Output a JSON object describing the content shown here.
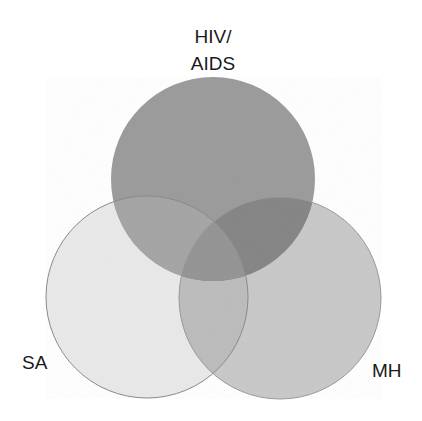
{
  "diagram": {
    "type": "venn",
    "sets": [
      {
        "id": "hiv",
        "label_lines": [
          "HIV/",
          "AIDS"
        ],
        "color": "#9a9a9a"
      },
      {
        "id": "sa",
        "label_lines": [
          "SA"
        ],
        "color": "#e9e9e9"
      },
      {
        "id": "mh",
        "label_lines": [
          "MH"
        ],
        "color": "#c9c9c9"
      }
    ],
    "labels": {
      "hiv_line1": "HIV/",
      "hiv_line2": "AIDS",
      "sa": "SA",
      "mh": "MH"
    }
  }
}
